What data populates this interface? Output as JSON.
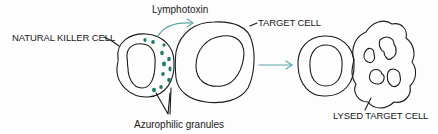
{
  "diagram": {
    "labels": {
      "natural_killer_cell": "NATURAL KILLER CELL",
      "lymphotoxin": "Lymphotoxin",
      "target_cell": "TARGET CELL",
      "azurophilic_granules": "Azurophilic granules",
      "lysed_target_cell": "LYSED TARGET CELL"
    },
    "colors": {
      "outline": "#1a1a1a",
      "granule": "#1f7a6a",
      "arrow": "#5aa8a8"
    },
    "stages": [
      {
        "name": "before",
        "cells": [
          "natural killer cell",
          "target cell"
        ]
      },
      {
        "name": "after",
        "cells": [
          "natural killer cell",
          "lysed target cell"
        ]
      }
    ]
  }
}
